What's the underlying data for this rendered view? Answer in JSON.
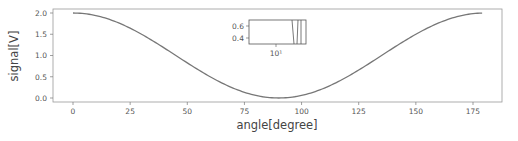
{
  "chart_data": {
    "type": "line",
    "title": "",
    "xlabel": "angle[degree]",
    "ylabel": "signal[V]",
    "xlim": [
      -12,
      190
    ],
    "ylim": [
      -0.1,
      2.1
    ],
    "xticks": [
      "0",
      "25",
      "50",
      "75",
      "100",
      "125",
      "150",
      "175"
    ],
    "yticks": [
      "0.0",
      "0.5",
      "1.0",
      "1.5",
      "2.0"
    ],
    "grid": false,
    "legend": null,
    "series": [
      {
        "name": "signal",
        "color": "#777777",
        "function": "1 + cos(2*angle)",
        "x": [
          0,
          10,
          20,
          30,
          40,
          50,
          60,
          70,
          80,
          90,
          100,
          110,
          120,
          130,
          140,
          150,
          160,
          170,
          179
        ],
        "values": [
          2.0,
          1.94,
          1.77,
          1.5,
          1.17,
          0.83,
          0.5,
          0.23,
          0.06,
          0.0,
          0.06,
          0.23,
          0.5,
          0.83,
          1.17,
          1.5,
          1.77,
          1.94,
          2.0
        ]
      }
    ],
    "inset": {
      "type": "line",
      "xscale": "log",
      "xticks": [
        "10¹"
      ],
      "yticks": [
        "0.6",
        "0.4"
      ]
    }
  }
}
